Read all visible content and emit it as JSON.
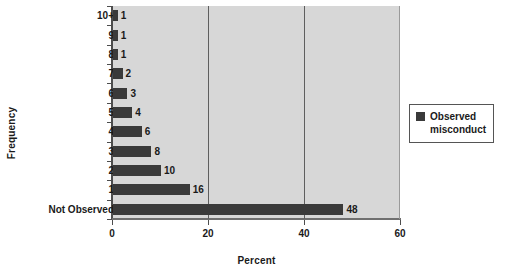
{
  "chart_data": {
    "type": "bar",
    "orientation": "horizontal",
    "title": "",
    "xlabel": "Percent",
    "ylabel": "Frequency",
    "xlim": [
      0,
      60
    ],
    "xticks": [
      0,
      20,
      40,
      60
    ],
    "grid": true,
    "grid_axis": "x",
    "legend_position": "right",
    "categories": [
      "10+",
      "9",
      "8",
      "7",
      "6",
      "5",
      "4",
      "3",
      "2",
      "1",
      "Not Observed"
    ],
    "values": [
      1,
      1,
      1,
      2,
      3,
      4,
      6,
      8,
      10,
      16,
      48
    ],
    "data_labels": [
      "1",
      "1",
      "1",
      "2",
      "3",
      "4",
      "6",
      "8",
      "10",
      "16",
      "48"
    ],
    "series": [
      {
        "name": "Observed misconduct",
        "color": "#3a3a3a",
        "values": [
          1,
          1,
          1,
          2,
          3,
          4,
          6,
          8,
          10,
          16,
          48
        ]
      }
    ]
  },
  "legend": {
    "entries": [
      {
        "label_line1": "Observed",
        "label_line2": "misconduct",
        "color": "#3a3a3a"
      }
    ]
  },
  "colors": {
    "plot_background": "#d7d7d7",
    "bar": "#3a3a3a",
    "axis": "#4d4d4d",
    "gridline": "#5e5e5e",
    "page_background": "#ffffff",
    "text": "#1a1a1a"
  }
}
